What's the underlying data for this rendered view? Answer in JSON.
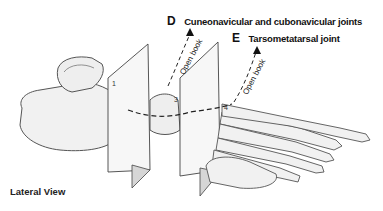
{
  "figure": {
    "type": "anatomical-illustration",
    "view_label": "Lateral View",
    "annotations": [
      {
        "letter": "D",
        "text": "Cuneonavicular and cubonavicular joints"
      },
      {
        "letter": "E",
        "text": "Tarsometatarsal joint"
      }
    ],
    "plane_labels": [
      "Open book",
      "Open book"
    ],
    "plane_numbers": [
      "1",
      "3",
      "4"
    ],
    "colors": {
      "bone_fill": "#f1f1f1",
      "bone_outline": "#555555",
      "plane_fill": "#f7f7f7",
      "plane_shadow": "#cfcfcf",
      "text": "#111111"
    }
  }
}
